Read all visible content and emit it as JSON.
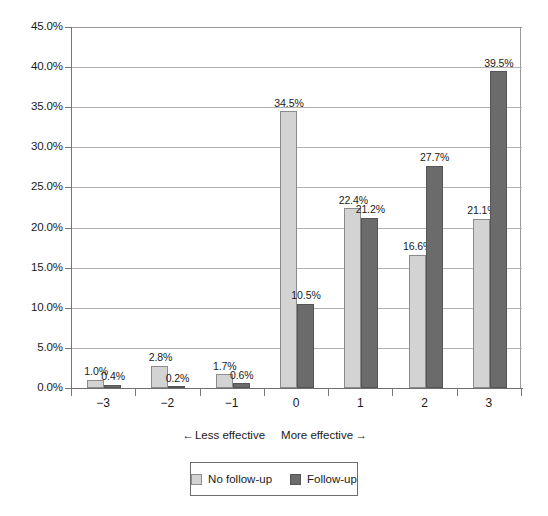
{
  "chart_data": {
    "type": "bar",
    "title": "",
    "subtitle": "",
    "xlabel": "",
    "ylabel": "",
    "categories": [
      "−3",
      "−2",
      "−1",
      "0",
      "1",
      "2",
      "3"
    ],
    "series": [
      {
        "name": "No follow-up",
        "color": "#d3d3d3",
        "values": [
          1.0,
          2.8,
          1.7,
          34.5,
          22.4,
          16.6,
          21.1
        ],
        "labels": [
          "1.0%",
          "2.8%",
          "1.7%",
          "34.5%",
          "22.4%",
          "16.6%",
          "21.1%"
        ]
      },
      {
        "name": "Follow-up",
        "color": "#6b6b6b",
        "values": [
          0.4,
          0.2,
          0.6,
          10.5,
          21.2,
          27.7,
          39.5
        ],
        "labels": [
          "0.4%",
          "0.2%",
          "0.6%",
          "10.5%",
          "21.2%",
          "27.7%",
          "39.5%"
        ]
      }
    ],
    "ylim": [
      0,
      45
    ],
    "ytick_values": [
      0,
      5,
      10,
      15,
      20,
      25,
      30,
      35,
      40,
      45
    ],
    "ytick_labels": [
      "0.0%",
      "5.0%",
      "10.0%",
      "15.0%",
      "20.0%",
      "25.0%",
      "30.0%",
      "35.0%",
      "40.0%",
      "45.0%"
    ],
    "grid": true,
    "legend_position": "bottom",
    "annotations": {
      "less_effective": "Less effective",
      "more_effective": "More effective",
      "left_arrow": "←",
      "right_arrow": "→"
    }
  },
  "legend": {
    "entries": [
      {
        "label": "No follow-up",
        "swatch": "light-gray-swatch"
      },
      {
        "label": "Follow-up",
        "swatch": "dark-gray-swatch"
      }
    ]
  }
}
